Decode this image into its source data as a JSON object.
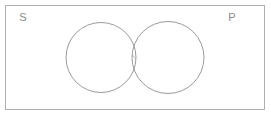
{
  "diagram": {
    "type": "venn-diagram",
    "canvas": {
      "width": 271,
      "height": 116,
      "background": "#ffffff"
    },
    "universe": {
      "name": "universe-rectangle",
      "x": 5.5,
      "y": 5.5,
      "width": 259,
      "height": 104,
      "stroke": "#b0b0b0",
      "stroke_width": 1,
      "fill": "#ffffff"
    },
    "circles": [
      {
        "id": "subject-circle",
        "label": "S",
        "cx": 101,
        "cy": 57.5,
        "r": 35,
        "stroke": "#8f8f8f",
        "stroke_width": 0.9,
        "fill": "none"
      },
      {
        "id": "predicate-circle",
        "label": "P",
        "cx": 168,
        "cy": 57.5,
        "r": 36,
        "stroke": "#8f8f8f",
        "stroke_width": 0.9,
        "fill": "none"
      }
    ],
    "labels": [
      {
        "id": "label-s",
        "text": "S",
        "x": 23,
        "y": 18,
        "color": "#8a8a8a",
        "font_size": 11
      },
      {
        "id": "label-p",
        "text": "P",
        "x": 232,
        "y": 18,
        "color": "#8a8a8a",
        "font_size": 11
      }
    ],
    "shading": {
      "region": "intersection",
      "style": "diagonal-hatch",
      "direction": "forward-slash",
      "line_spacing": 9,
      "stroke": "#8f8f8f",
      "stroke_width": 0.9,
      "line_count": 6
    },
    "colors": {
      "background": "#ffffff",
      "border": "#b0b0b0",
      "stroke": "#8f8f8f",
      "label": "#8a8a8a"
    }
  }
}
